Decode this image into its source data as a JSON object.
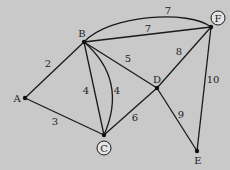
{
  "diagram": {
    "type": "weighted-graph",
    "background": "#c9c9c9",
    "nodes": [
      {
        "id": "A",
        "label": "A",
        "x": 25,
        "y": 98,
        "label_x": 17,
        "label_y": 102,
        "circled": false
      },
      {
        "id": "B",
        "label": "B",
        "x": 84,
        "y": 42,
        "label_x": 82,
        "label_y": 37,
        "circled": false
      },
      {
        "id": "C",
        "label": "C",
        "x": 104,
        "y": 135,
        "label_x": 104,
        "label_y": 151,
        "circled": true,
        "ring_cx": 104,
        "ring_cy": 148
      },
      {
        "id": "D",
        "label": "D",
        "x": 157,
        "y": 88,
        "label_x": 157,
        "label_y": 83,
        "circled": false
      },
      {
        "id": "E",
        "label": "E",
        "x": 197,
        "y": 151,
        "label_x": 198,
        "label_y": 164,
        "circled": false
      },
      {
        "id": "F",
        "label": "F",
        "x": 211,
        "y": 27,
        "label_x": 218,
        "label_y": 21,
        "circled": true,
        "ring_cx": 218,
        "ring_cy": 18
      }
    ],
    "edges": [
      {
        "from": "A",
        "to": "B",
        "weight": "2",
        "label_x": 48,
        "label_y": 67
      },
      {
        "from": "A",
        "to": "C",
        "weight": "3",
        "label_x": 55,
        "label_y": 125
      },
      {
        "from": "B",
        "to": "C",
        "weight": "4",
        "label_x": 86,
        "label_y": 94,
        "shape": "straight"
      },
      {
        "from": "B",
        "to": "C",
        "weight": "4",
        "label_x": 117,
        "label_y": 94,
        "shape": "curved"
      },
      {
        "from": "B",
        "to": "D",
        "weight": "5",
        "label_x": 128,
        "label_y": 62
      },
      {
        "from": "C",
        "to": "D",
        "weight": "6",
        "label_x": 135,
        "label_y": 121
      },
      {
        "from": "B",
        "to": "F",
        "weight": "7",
        "label_x": 148,
        "label_y": 32,
        "shape": "straight"
      },
      {
        "from": "B",
        "to": "F",
        "weight": "7",
        "label_x": 168,
        "label_y": 14,
        "shape": "curved"
      },
      {
        "from": "D",
        "to": "F",
        "weight": "8",
        "label_x": 179,
        "label_y": 55
      },
      {
        "from": "D",
        "to": "E",
        "weight": "9",
        "label_x": 181,
        "label_y": 118
      },
      {
        "from": "F",
        "to": "E",
        "weight": "10",
        "label_x": 212,
        "label_y": 83
      }
    ]
  }
}
